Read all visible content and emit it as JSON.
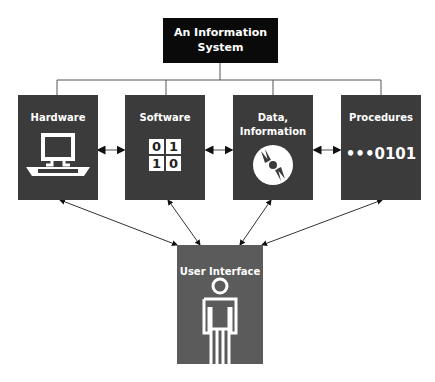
{
  "title": {
    "line1": "An Information",
    "line2": "System"
  },
  "components": [
    {
      "id": "hardware",
      "label_line1": "Hardware",
      "label_line2": "",
      "icon": "computer-icon"
    },
    {
      "id": "software",
      "label_line1": "Software",
      "label_line2": "",
      "icon": "binary-grid-icon",
      "icon_text": [
        "0",
        "1",
        "1",
        "0"
      ]
    },
    {
      "id": "data",
      "label_line1": "Data,",
      "label_line2": "Information",
      "icon": "disc-icon"
    },
    {
      "id": "procedures",
      "label_line1": "Procedures",
      "label_line2": "",
      "icon": "sequence-icon",
      "icon_text": "•••0101"
    }
  ],
  "user_interface": {
    "label": "User Interface",
    "icon": "person-icon"
  },
  "colors": {
    "title_box": "#0a0a0a",
    "component_box": "#3b3b3b",
    "ui_box": "#5b5b5b",
    "lines": "#555555"
  }
}
